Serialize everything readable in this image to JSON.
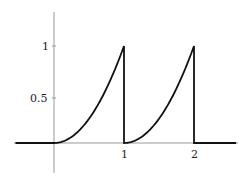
{
  "chart_data": {
    "type": "line",
    "title": "",
    "xlabel": "",
    "ylabel": "",
    "x_ticks": [
      "1",
      "2"
    ],
    "y_ticks": [
      "0.5",
      "1"
    ],
    "xlim": [
      -0.55,
      2.7
    ],
    "ylim": [
      -0.32,
      1.35
    ],
    "grid": false,
    "legend": null,
    "series": [
      {
        "name": "f(x)",
        "x": [
          -0.5,
          0,
          0.25,
          0.5,
          0.75,
          1,
          1,
          1.25,
          1.5,
          1.75,
          2,
          2,
          2.6
        ],
        "y": [
          0,
          0,
          0.0625,
          0.25,
          0.5625,
          1,
          0,
          0.0625,
          0.25,
          0.5625,
          1,
          0,
          0
        ]
      }
    ]
  },
  "labels": {
    "x_tick_1": "1",
    "x_tick_2": "2",
    "y_tick_half": "0.5",
    "y_tick_one": "1"
  }
}
